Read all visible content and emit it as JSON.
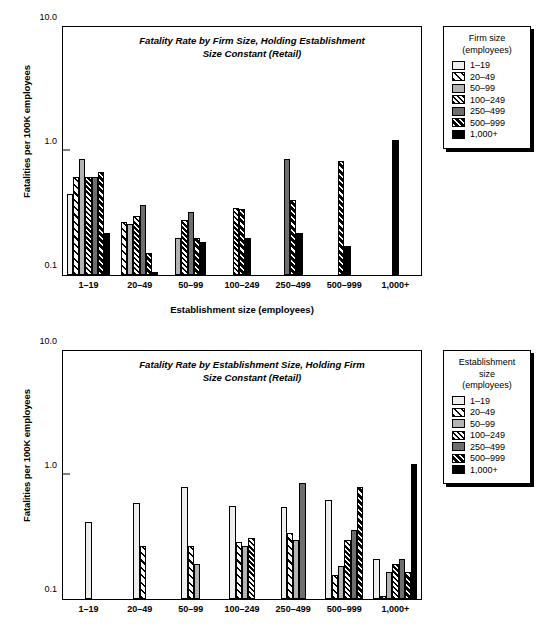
{
  "figure": {
    "background": "#ffffff",
    "series_colors": [
      "#eeeeee",
      "#ffffff",
      "#b3b3b3",
      "#ffffff",
      "#6e6e6e",
      "#000000",
      "#000000"
    ]
  },
  "chart_data": [
    {
      "type": "bar",
      "panel": "top",
      "title": "Fatality Rate by Firm Size, Holding Establishment Size Constant (Retail)",
      "title_line1": "Fatality Rate by Firm Size, Holding Establishment",
      "title_line2": "Size Constant (Retail)",
      "xlabel": "Establishment size (employees)",
      "ylabel": "Fatalities per 100K employees",
      "yscale": "log",
      "ylim": [
        0.1,
        10.0
      ],
      "yticks": [
        0.1,
        1.0,
        10.0
      ],
      "ytick_labels": [
        "0.1",
        "1.0",
        "10.0"
      ],
      "grid": false,
      "legend_position": "right-outside",
      "legend_title": "Firm size (employees)",
      "categories": [
        "1–19",
        "20–49",
        "50–99",
        "100–249",
        "250–499",
        "500–999",
        "1,000+"
      ],
      "series": [
        {
          "name": "1–19",
          "values": [
            0.45,
            null,
            null,
            null,
            null,
            null,
            null
          ]
        },
        {
          "name": "20–49",
          "values": [
            0.62,
            0.27,
            null,
            null,
            null,
            null,
            null
          ]
        },
        {
          "name": "50–99",
          "values": [
            0.86,
            0.26,
            0.2,
            null,
            null,
            null,
            null
          ]
        },
        {
          "name": "100–249",
          "values": [
            0.62,
            0.3,
            0.28,
            0.35,
            null,
            null,
            null
          ]
        },
        {
          "name": "250–499",
          "values": [
            0.62,
            0.37,
            0.32,
            null,
            0.86,
            null,
            null
          ]
        },
        {
          "name": "500–999",
          "values": [
            0.68,
            0.15,
            0.2,
            0.34,
            0.4,
            0.83,
            null
          ]
        },
        {
          "name": "1,000+",
          "values": [
            0.22,
            0.105,
            0.185,
            0.2,
            0.22,
            0.17,
            1.22
          ]
        }
      ]
    },
    {
      "type": "bar",
      "panel": "bottom",
      "title": "Fatality Rate by Establishment Size, Holding Firm Size Constant (Retail)",
      "title_line1": "Fatality Rate by Establishment Size, Holding Firm",
      "title_line2": "Size Constant (Retail)",
      "xlabel": "",
      "ylabel": "Fatalities per 100K employees",
      "yscale": "log",
      "ylim": [
        0.1,
        10.0
      ],
      "yticks": [
        0.1,
        1.0,
        10.0
      ],
      "ytick_labels": [
        "0.1",
        "1.0",
        "10.0"
      ],
      "grid": false,
      "legend_position": "right-outside",
      "legend_title": "Establishment size (employees)",
      "categories": [
        "1–19",
        "20–49",
        "50–99",
        "100–249",
        "250–499",
        "500–999",
        "1,000+"
      ],
      "series": [
        {
          "name": "1–19",
          "values": [
            0.42,
            0.6,
            0.8,
            0.56,
            0.55,
            0.63,
            0.21
          ]
        },
        {
          "name": "20–49",
          "values": [
            null,
            0.27,
            0.27,
            0.29,
            0.34,
            0.155,
            0.105
          ]
        },
        {
          "name": "50–99",
          "values": [
            null,
            null,
            0.19,
            0.27,
            0.3,
            0.185,
            0.165
          ]
        },
        {
          "name": "100–249",
          "values": [
            null,
            null,
            null,
            0.31,
            null,
            0.3,
            0.19
          ]
        },
        {
          "name": "250–499",
          "values": [
            null,
            null,
            null,
            null,
            0.86,
            0.36,
            0.21
          ]
        },
        {
          "name": "500–999",
          "values": [
            null,
            null,
            null,
            null,
            null,
            0.8,
            0.165
          ]
        },
        {
          "name": "1,000+",
          "values": [
            null,
            null,
            null,
            null,
            null,
            null,
            1.22
          ]
        }
      ]
    }
  ],
  "top_legend": {
    "title_line1": "Firm size",
    "title_line2": "(employees)",
    "items": [
      {
        "label": "1–19",
        "pattern": "light-gray-solid"
      },
      {
        "label": "20–49",
        "pattern": "wide-diagonal-hatch"
      },
      {
        "label": "50–99",
        "pattern": "medium-gray-solid"
      },
      {
        "label": "100–249",
        "pattern": "dense-diagonal-hatch"
      },
      {
        "label": "250–499",
        "pattern": "dark-gray-solid"
      },
      {
        "label": "500–999",
        "pattern": "black-diagonal-hatch"
      },
      {
        "label": "1,000+",
        "pattern": "black-solid"
      }
    ]
  },
  "bottom_legend": {
    "title_line1": "Establishment",
    "title_line2": "size",
    "title_line3": "(employees)",
    "items": [
      {
        "label": "1–19",
        "pattern": "light-gray-solid"
      },
      {
        "label": "20–49",
        "pattern": "wide-diagonal-hatch"
      },
      {
        "label": "50–99",
        "pattern": "medium-gray-solid"
      },
      {
        "label": "100–249",
        "pattern": "dense-diagonal-hatch"
      },
      {
        "label": "250–499",
        "pattern": "dark-gray-solid"
      },
      {
        "label": "500–999",
        "pattern": "black-diagonal-hatch"
      },
      {
        "label": "1,000+",
        "pattern": "black-solid"
      }
    ]
  }
}
